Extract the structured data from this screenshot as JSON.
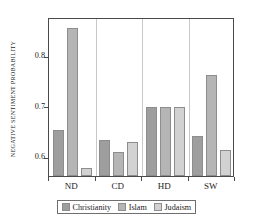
{
  "chart_data": {
    "type": "bar",
    "title": "",
    "xlabel": "",
    "ylabel": "Negative sentiment probability",
    "categories": [
      "ND",
      "CD",
      "HD",
      "SW"
    ],
    "series": [
      {
        "name": "Christianity",
        "color": "#9e9e9e",
        "values": [
          0.652,
          0.632,
          0.697,
          0.64
        ]
      },
      {
        "name": "Islam",
        "color": "#b5b5b5",
        "values": [
          0.853,
          0.607,
          0.697,
          0.761
        ]
      },
      {
        "name": "Judaism",
        "color": "#d2d2d2",
        "values": [
          0.576,
          0.628,
          0.697,
          0.612
        ]
      }
    ],
    "ylim": [
      0.56,
      0.875
    ],
    "yticks": [
      0.6,
      0.7,
      0.8
    ],
    "ytick_labels": [
      "0.6",
      "0.7",
      "0.8"
    ],
    "grid": "vertical-group-separators",
    "legend_position": "below-axis-center"
  },
  "legend": {
    "entries": [
      {
        "label": "Christianity"
      },
      {
        "label": "Islam"
      },
      {
        "label": "Judaism"
      }
    ]
  },
  "axes": {
    "y_title": "Negative sentiment probability",
    "x_tick_labels": [
      "ND",
      "CD",
      "HD",
      "SW"
    ],
    "y_tick_labels": [
      "0.6",
      "0.7",
      "0.8"
    ]
  }
}
